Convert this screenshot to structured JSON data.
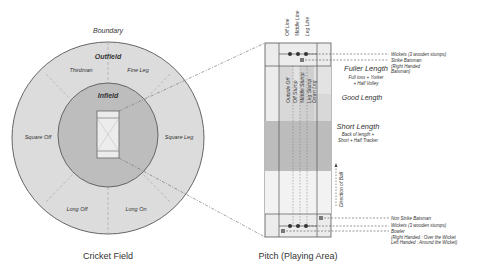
{
  "field": {
    "caption": "Cricket Field",
    "boundary_label": "Boundary",
    "outfield_label": "Outfield",
    "infield_label": "Infield",
    "positions": [
      "Thirdman",
      "Fine Leg",
      "Square Off",
      "Square Leg",
      "Long Off",
      "Long On"
    ]
  },
  "pitch": {
    "caption": "Pitch (Playing Area)",
    "top_lines": [
      "Off Line",
      "Middle Line",
      "Leg Line"
    ],
    "stump_columns": [
      "Outside Off",
      "Off Stump",
      "Middle Stump",
      "Leg Stump",
      "Down Leg"
    ],
    "zones": {
      "fuller": {
        "title": "Fuller Length",
        "sub1": "Full toss + Yorker",
        "sub2": "+ Half Volley"
      },
      "good": {
        "title": "Good Length"
      },
      "short": {
        "title": "Short Length",
        "sub1": "Back of length +",
        "sub2": "Short + Half Tracker"
      }
    },
    "direction_label": "Direction of Ball",
    "callouts": {
      "wickets_top": "Wickets (3 wooden stumps)",
      "strike_batsman": "Strike Batsman",
      "strike_batsman_note1": "(Right Handed",
      "strike_batsman_note2": "Batsman)",
      "non_strike": "Non Strike Batsman",
      "wickets_bottom": "Wickets (3 wooden stumps)",
      "bowler": "Bowler",
      "bowler_note1": "(Right Handed : Over the Wicket",
      "bowler_note2": "Left Handed : Around the Wicket)"
    }
  },
  "colors": {
    "outfield": "#dcdcdc",
    "infield": "#bdbdbd",
    "pitch_light": "#e6e6e6",
    "short_zone": "#bcbcbc",
    "line": "#555555"
  }
}
